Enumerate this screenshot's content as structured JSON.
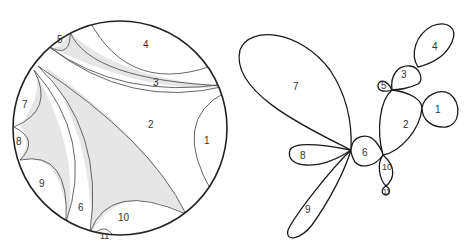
{
  "figure": {
    "left_panel": {
      "description": "disk with geodesic arcs partitioning into numbered regions, shaded gaps",
      "region_labels": [
        "1",
        "2",
        "3",
        "4",
        "5",
        "6",
        "7",
        "8",
        "9",
        "10",
        "11"
      ],
      "shade_color": "#e6e6e6",
      "stroke_color": "#222222"
    },
    "right_panel": {
      "description": "tree of lobes (cactus) corresponding to disk regions",
      "lobe_labels": [
        "1",
        "2",
        "3",
        "4",
        "5",
        "6",
        "7",
        "8",
        "9",
        "10",
        "11"
      ],
      "stroke_color": "#1a1a1a"
    }
  },
  "labels": {
    "l1": "1",
    "l2": "2",
    "l3": "3",
    "l4": "4",
    "l5": "5",
    "l6": "6",
    "l7": "7",
    "l8": "8",
    "l9": "9",
    "l10": "10",
    "l11": "11"
  }
}
